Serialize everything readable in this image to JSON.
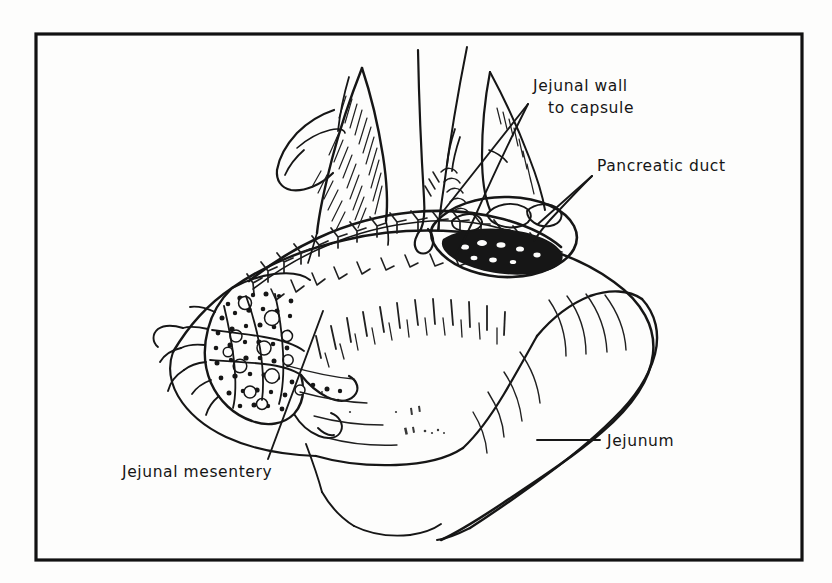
{
  "figure": {
    "kind": "medical-line-illustration",
    "technique": "pen-and-ink surgical drawing",
    "background_color": "#fdfdfc",
    "ink_color": "#161616",
    "frame": {
      "visible": true,
      "color": "#121212",
      "stroke_width": 3.2,
      "x": 36,
      "y": 34,
      "width": 766,
      "height": 526
    }
  },
  "labels": [
    {
      "id": "jejunal-wall-to-capsule",
      "lines": [
        "Jejunal wall",
        "to capsule"
      ],
      "line1": "Jejunal wall",
      "line2": "to capsule",
      "text_x": 533,
      "text_y": 91,
      "align": "start",
      "leader": {
        "from_x": 528,
        "from_y": 104,
        "to_x": 441,
        "to_y": 214
      }
    },
    {
      "id": "pancreatic-duct",
      "lines": [
        "Pancreatic duct"
      ],
      "line1": "Pancreatic duct",
      "text_x": 597,
      "text_y": 171,
      "align": "start",
      "leader": {
        "from_x": 592,
        "from_y": 176,
        "to_x": 538,
        "to_y": 224
      }
    },
    {
      "id": "jejunum",
      "lines": [
        "Jejunum"
      ],
      "line1": "Jejunum",
      "text_x": 607,
      "text_y": 446,
      "align": "start",
      "leader": {
        "from_x": 537,
        "from_y": 440,
        "to_x": 600,
        "to_y": 440
      }
    },
    {
      "id": "jejunal-mesentery",
      "lines": [
        "Jejunal mesentery"
      ],
      "line1": "Jejunal mesentery",
      "text_x": 122,
      "text_y": 477,
      "align": "start",
      "leader": {
        "from_x": 268,
        "from_y": 459,
        "to_x": 323,
        "to_y": 311
      }
    }
  ],
  "anatomy_parts": [
    {
      "id": "pancreas-body",
      "name": "Pancreas body"
    },
    {
      "id": "jejunal-limb",
      "name": "Jejunal limb"
    },
    {
      "id": "jejunal-mesentery-fat",
      "name": "Jejunal mesentery fat and vessels"
    },
    {
      "id": "suture-line",
      "name": "Interrupted suture line"
    },
    {
      "id": "pancreatic-duct-orifice",
      "name": "Pancreatic duct orifice"
    },
    {
      "id": "retracted-flap",
      "name": "Retracted serosal flap"
    },
    {
      "id": "traction-sutures",
      "name": "Traction sutures"
    }
  ]
}
